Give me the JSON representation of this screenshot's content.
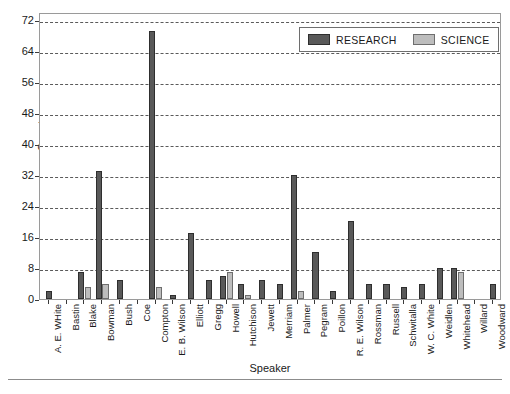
{
  "chart_data": {
    "type": "bar",
    "title": "",
    "xlabel": "Speaker",
    "ylabel": "Count",
    "ylim": [
      0,
      74
    ],
    "yticks": [
      0,
      8,
      16,
      24,
      32,
      40,
      48,
      56,
      64,
      72
    ],
    "grid": true,
    "legend_position": "top-right",
    "categories": [
      "A. E. WHite",
      "Bastin",
      "Blake",
      "Bowman",
      "Bush",
      "Coe",
      "Compton",
      "E. B. Wilson",
      "Elliott",
      "Gregg",
      "Howell",
      "Hutchison",
      "Jewett",
      "Merriam",
      "Palmer",
      "Pegram",
      "Poillon",
      "R. E. Wilson",
      "Rossman",
      "Russell",
      "Schwitalla",
      "W. C. White",
      "Weidlen",
      "Whitehead",
      "Willard",
      "Woodward"
    ],
    "series": [
      {
        "name": "RESEARCH",
        "color": "#595959",
        "values": [
          2,
          0,
          7,
          33,
          5,
          0,
          69,
          1,
          17,
          5,
          6,
          4,
          5,
          4,
          32,
          12,
          2,
          20,
          4,
          4,
          3,
          4,
          8,
          8,
          0,
          4
        ]
      },
      {
        "name": "SCIENCE",
        "color": "#bdbdbd",
        "values": [
          0,
          0,
          3,
          4,
          0,
          0,
          3,
          0,
          0,
          0,
          7,
          1,
          0,
          0,
          2,
          0,
          0,
          0,
          0,
          0,
          0,
          0,
          0,
          7,
          0,
          0
        ]
      }
    ]
  },
  "legend": {
    "entries": [
      {
        "label": "RESEARCH",
        "swatch": "research"
      },
      {
        "label": "SCIENCE",
        "swatch": "science"
      }
    ]
  },
  "axes": {
    "y_title": "Count",
    "x_title": "Speaker"
  }
}
